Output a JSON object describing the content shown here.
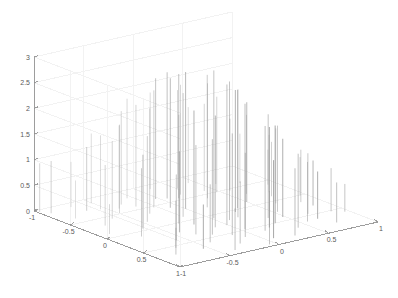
{
  "figure": {
    "title": "",
    "background_color": "#ffffff",
    "axis_line_color": "#8f8f8f",
    "grid_color": "#f2f2f2",
    "stem_color": "#9a9a9a",
    "tick_label_color": "#5a5a5a"
  },
  "chart_data": {
    "type": "bar",
    "render_style": "3d-stem",
    "title": "",
    "xlabel": "",
    "ylabel": "",
    "zlabel": "",
    "grid": true,
    "legend": "none",
    "xlim": [
      -1,
      1
    ],
    "ylim": [
      -1,
      1
    ],
    "zlim": [
      0,
      3
    ],
    "xticks": [
      -1,
      -0.5,
      0,
      0.5,
      1
    ],
    "xticklabels": [
      "-1",
      "-0.5",
      "0",
      "0.5",
      "1"
    ],
    "yticks": [
      -1,
      -0.5,
      0,
      0.5,
      1
    ],
    "yticklabels": [
      "-1",
      "-0.5",
      "0",
      "0.5",
      "1"
    ],
    "zticks": [
      0,
      0.5,
      1,
      1.5,
      2,
      2.5,
      3
    ],
    "zticklabels": [
      "0",
      "0.5",
      "1",
      "1.5",
      "2",
      "2.5",
      "3"
    ],
    "view": {
      "azimuth": -37.5,
      "elevation": 30
    },
    "points": [
      {
        "x": -0.93,
        "y": 0.86,
        "z": 1.02
      },
      {
        "x": -0.86,
        "y": 0.62,
        "z": 0.74
      },
      {
        "x": -0.79,
        "y": 0.31,
        "z": 1.18
      },
      {
        "x": -0.74,
        "y": -0.12,
        "z": 1.33
      },
      {
        "x": -0.71,
        "y": -0.55,
        "z": 0.92
      },
      {
        "x": -0.66,
        "y": 0.74,
        "z": 1.24
      },
      {
        "x": -0.63,
        "y": 0.43,
        "z": 1.51
      },
      {
        "x": -0.6,
        "y": 0.05,
        "z": 1.44
      },
      {
        "x": -0.58,
        "y": -0.38,
        "z": 1.28
      },
      {
        "x": -0.55,
        "y": -0.71,
        "z": 0.86
      },
      {
        "x": -0.51,
        "y": 0.88,
        "z": 1.36
      },
      {
        "x": -0.49,
        "y": 0.52,
        "z": 1.72
      },
      {
        "x": -0.46,
        "y": 0.18,
        "z": 1.67
      },
      {
        "x": -0.43,
        "y": -0.22,
        "z": 1.58
      },
      {
        "x": -0.4,
        "y": -0.6,
        "z": 1.13
      },
      {
        "x": -0.37,
        "y": -0.9,
        "z": 0.81
      },
      {
        "x": -0.34,
        "y": 0.7,
        "z": 1.82
      },
      {
        "x": -0.31,
        "y": 0.35,
        "z": 2.05
      },
      {
        "x": -0.29,
        "y": -0.02,
        "z": 2.12
      },
      {
        "x": -0.26,
        "y": -0.44,
        "z": 1.86
      },
      {
        "x": -0.23,
        "y": -0.78,
        "z": 1.21
      },
      {
        "x": -0.2,
        "y": 0.81,
        "z": 1.94
      },
      {
        "x": -0.18,
        "y": 0.47,
        "z": 2.28
      },
      {
        "x": -0.15,
        "y": 0.11,
        "z": 2.41
      },
      {
        "x": -0.12,
        "y": -0.29,
        "z": 2.18
      },
      {
        "x": -0.09,
        "y": -0.66,
        "z": 1.64
      },
      {
        "x": -0.06,
        "y": -0.95,
        "z": 1.04
      },
      {
        "x": -0.03,
        "y": 0.65,
        "z": 2.35
      },
      {
        "x": 0.0,
        "y": 0.28,
        "z": 2.66
      },
      {
        "x": 0.02,
        "y": -0.08,
        "z": 2.88
      },
      {
        "x": 0.04,
        "y": -0.48,
        "z": 2.44
      },
      {
        "x": 0.07,
        "y": -0.83,
        "z": 1.52
      },
      {
        "x": 0.1,
        "y": 0.9,
        "z": 1.88
      },
      {
        "x": 0.13,
        "y": 0.55,
        "z": 2.42
      },
      {
        "x": 0.16,
        "y": 0.2,
        "z": 2.58
      },
      {
        "x": 0.19,
        "y": -0.18,
        "z": 2.49
      },
      {
        "x": 0.22,
        "y": -0.57,
        "z": 1.96
      },
      {
        "x": 0.25,
        "y": -0.88,
        "z": 1.31
      },
      {
        "x": 0.28,
        "y": 0.77,
        "z": 1.92
      },
      {
        "x": 0.31,
        "y": 0.4,
        "z": 2.24
      },
      {
        "x": 0.34,
        "y": 0.03,
        "z": 2.3
      },
      {
        "x": 0.37,
        "y": -0.35,
        "z": 2.02
      },
      {
        "x": 0.4,
        "y": -0.72,
        "z": 1.44
      },
      {
        "x": 0.44,
        "y": 0.84,
        "z": 1.48
      },
      {
        "x": 0.47,
        "y": 0.49,
        "z": 1.86
      },
      {
        "x": 0.5,
        "y": 0.12,
        "z": 1.94
      },
      {
        "x": 0.53,
        "y": -0.26,
        "z": 1.68
      },
      {
        "x": 0.56,
        "y": -0.63,
        "z": 1.16
      },
      {
        "x": 0.6,
        "y": 0.68,
        "z": 1.32
      },
      {
        "x": 0.63,
        "y": 0.3,
        "z": 1.54
      },
      {
        "x": 0.66,
        "y": -0.06,
        "z": 1.46
      },
      {
        "x": 0.69,
        "y": -0.46,
        "z": 1.18
      },
      {
        "x": 0.73,
        "y": -0.8,
        "z": 0.78
      },
      {
        "x": 0.77,
        "y": 0.58,
        "z": 0.96
      },
      {
        "x": 0.8,
        "y": 0.22,
        "z": 1.12
      },
      {
        "x": 0.84,
        "y": -0.16,
        "z": 1.02
      },
      {
        "x": 0.88,
        "y": -0.52,
        "z": 0.84
      },
      {
        "x": 0.92,
        "y": 0.4,
        "z": 0.68
      },
      {
        "x": 0.95,
        "y": 0.0,
        "z": 0.74
      }
    ],
    "extra_spikes": [
      {
        "x": -0.98,
        "y": 0.95,
        "z": 0.95
      },
      {
        "x": -0.9,
        "y": 0.1,
        "z": 0.58
      },
      {
        "x": -0.82,
        "y": -0.7,
        "z": 0.52
      },
      {
        "x": -0.7,
        "y": 0.9,
        "z": 0.88
      },
      {
        "x": -0.55,
        "y": 0.7,
        "z": 1.44
      },
      {
        "x": -0.42,
        "y": 0.62,
        "z": 1.62
      },
      {
        "x": -0.36,
        "y": -0.35,
        "z": 1.74
      },
      {
        "x": -0.28,
        "y": 0.58,
        "z": 1.98
      },
      {
        "x": -0.21,
        "y": -0.12,
        "z": 2.22
      },
      {
        "x": -0.14,
        "y": -0.55,
        "z": 1.98
      },
      {
        "x": -0.08,
        "y": 0.38,
        "z": 2.52
      },
      {
        "x": -0.01,
        "y": -0.3,
        "z": 2.74
      },
      {
        "x": 0.05,
        "y": 0.6,
        "z": 2.46
      },
      {
        "x": 0.09,
        "y": -0.2,
        "z": 2.7
      },
      {
        "x": 0.14,
        "y": -0.62,
        "z": 2.04
      },
      {
        "x": 0.2,
        "y": 0.62,
        "z": 2.14
      },
      {
        "x": 0.26,
        "y": -0.05,
        "z": 2.38
      },
      {
        "x": 0.33,
        "y": -0.5,
        "z": 1.9
      },
      {
        "x": 0.41,
        "y": 0.58,
        "z": 1.7
      },
      {
        "x": 0.48,
        "y": -0.4,
        "z": 1.52
      },
      {
        "x": 0.58,
        "y": 0.46,
        "z": 1.4
      },
      {
        "x": 0.67,
        "y": -0.62,
        "z": 0.92
      },
      {
        "x": 0.75,
        "y": 0.12,
        "z": 1.06
      },
      {
        "x": 0.86,
        "y": -0.3,
        "z": 0.88
      },
      {
        "x": 0.96,
        "y": -0.6,
        "z": 0.54
      }
    ]
  }
}
